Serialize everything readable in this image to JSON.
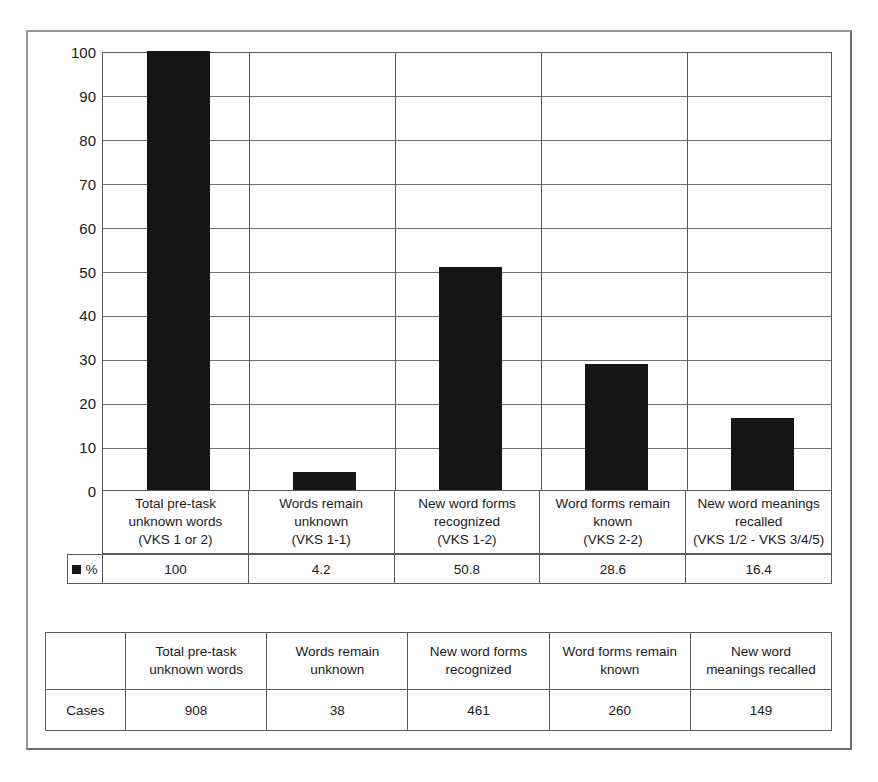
{
  "chart_data": {
    "type": "bar",
    "title": "",
    "subtitle": "",
    "xlabel": "",
    "ylabel": "",
    "ylim": [
      0,
      100
    ],
    "yticks": [
      0,
      10,
      20,
      30,
      40,
      50,
      60,
      70,
      80,
      90,
      100
    ],
    "grid": true,
    "legend_position": "below-plot",
    "series_name": "%",
    "series_color": "#151515",
    "categories": [
      "Total pre-task unknown words (VKS 1 or 2)",
      "Words remain unknown (VKS 1-1)",
      "New word forms recognized (VKS 1-2)",
      "Word forms remain known (VKS 2-2)",
      "New word meanings recalled (VKS 1/2 - VKS 3/4/5)"
    ],
    "values": [
      100,
      4.2,
      50.8,
      28.6,
      16.4
    ],
    "value_labels": [
      "100",
      "4.2",
      "50.8",
      "28.6",
      "16.4"
    ],
    "counts": [
      908,
      38,
      461,
      260,
      149
    ]
  },
  "axis": {
    "ytick_labels": [
      "100",
      "90",
      "80",
      "70",
      "60",
      "50",
      "40",
      "30",
      "20",
      "10",
      "0"
    ]
  },
  "category_table": {
    "cells": [
      {
        "line1": "Total pre-task",
        "line2": "unknown words",
        "line3": "(VKS 1 or 2)"
      },
      {
        "line1": "Words remain",
        "line2": "unknown",
        "line3": "(VKS 1-1)"
      },
      {
        "line1": "New word forms",
        "line2": "recognized",
        "line3": "(VKS 1-2)"
      },
      {
        "line1": "Word forms remain",
        "line2": "known",
        "line3": "(VKS 2-2)"
      },
      {
        "line1": "New word meanings",
        "line2": "recalled",
        "line3": "(VKS 1/2 - VKS 3/4/5)"
      }
    ]
  },
  "percent_row": {
    "legend_label": "%",
    "values": [
      "100",
      "4.2",
      "50.8",
      "28.6",
      "16.4"
    ]
  },
  "cases_table": {
    "row_label": "Cases",
    "headers": [
      {
        "line1": "Total pre-task",
        "line2": "unknown words"
      },
      {
        "line1": "Words remain",
        "line2": "unknown"
      },
      {
        "line1": "New word forms",
        "line2": "recognized"
      },
      {
        "line1": "Word forms remain",
        "line2": "known"
      },
      {
        "line1": "New word",
        "line2": "meanings recalled"
      }
    ],
    "values": [
      "908",
      "38",
      "461",
      "260",
      "149"
    ]
  },
  "colors": {
    "bar": "#151515",
    "grid": "#6f6f6f",
    "border": "#5a5a5a",
    "frame": "#8a8a8a",
    "background": "#ffffff"
  }
}
